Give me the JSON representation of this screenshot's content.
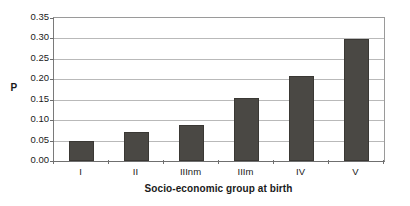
{
  "chart_data": {
    "type": "bar",
    "title": "",
    "subtitle": "",
    "xlabel": "Socio-economic group at birth",
    "ylabel": "P",
    "categories": [
      "I",
      "II",
      "IIInm",
      "IIIm",
      "IV",
      "V"
    ],
    "values": [
      0.049,
      0.072,
      0.089,
      0.154,
      0.207,
      0.298
    ],
    "series": [
      {
        "name": "P",
        "values": [
          0.049,
          0.072,
          0.089,
          0.154,
          0.207,
          0.298
        ]
      }
    ],
    "ylim": [
      0.0,
      0.35
    ],
    "ytick_values": [
      0.0,
      0.05,
      0.1,
      0.15,
      0.2,
      0.25,
      0.3,
      0.35
    ],
    "ytick_labels": [
      "0.00",
      "0.05",
      "0.10",
      "0.15",
      "0.20",
      "0.25",
      "0.30",
      "0.35"
    ],
    "grid": true,
    "grid_axis": "y",
    "legend": false,
    "legend_position": "none",
    "bar_color": "#4a4844",
    "grid_color": "#b9b9b9",
    "axis_color": "#6f6f6f",
    "plot_background": "#ffffff",
    "annotations": []
  }
}
